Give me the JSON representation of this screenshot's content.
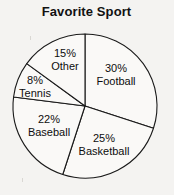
{
  "chart_data": {
    "type": "pie",
    "title": "Favorite Sport",
    "xlabel": "",
    "ylabel": "",
    "legend_position": "none",
    "grid": false,
    "start_angle_deg": 0,
    "direction": "clockwise",
    "categories": [
      "Football",
      "Basketball",
      "Baseball",
      "Tennis",
      "Other"
    ],
    "values": [
      30,
      25,
      22,
      8,
      15
    ],
    "value_unit": "%",
    "slices": [
      {
        "label": "Football",
        "value": 30,
        "percent_text": "30%",
        "name_text": "Football",
        "start_deg": 0,
        "end_deg": 108,
        "fill": "#faf9f7",
        "stroke": "#1a1a1a"
      },
      {
        "label": "Basketball",
        "value": 25,
        "percent_text": "25%",
        "name_text": "Basketball",
        "start_deg": 108,
        "end_deg": 198,
        "fill": "#faf9f7",
        "stroke": "#1a1a1a"
      },
      {
        "label": "Baseball",
        "value": 22,
        "percent_text": "22%",
        "name_text": "Baseball",
        "start_deg": 198,
        "end_deg": 277.2,
        "fill": "#faf9f7",
        "stroke": "#1a1a1a"
      },
      {
        "label": "Tennis",
        "value": 8,
        "percent_text": "8%",
        "name_text": "Tennis",
        "start_deg": 277.2,
        "end_deg": 306,
        "fill": "#faf9f7",
        "stroke": "#1a1a1a"
      },
      {
        "label": "Other",
        "value": 15,
        "percent_text": "15%",
        "name_text": "Other",
        "start_deg": 306,
        "end_deg": 360,
        "fill": "#faf9f7",
        "stroke": "#1a1a1a"
      }
    ]
  },
  "geometry": {
    "center_x": 85,
    "center_y": 106,
    "radius": 72
  },
  "colors": {
    "background": "#f4f3f1",
    "slice_fill": "#faf9f7",
    "outline": "#1a1a1a",
    "text": "#0d0d0d"
  }
}
